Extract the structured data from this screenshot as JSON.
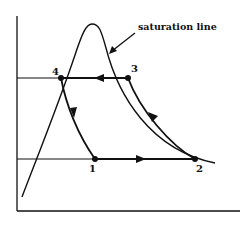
{
  "diagram": {
    "annotation": "saturation line",
    "points": [
      {
        "id": "1",
        "label": "1"
      },
      {
        "id": "2",
        "label": "2"
      },
      {
        "id": "3",
        "label": "3"
      },
      {
        "id": "4",
        "label": "4"
      }
    ],
    "processes": [
      {
        "from": "1",
        "to": "2",
        "type": "horizontal, arrow pointing right"
      },
      {
        "from": "2",
        "to": "3",
        "type": "curved, arrow pointing up-left"
      },
      {
        "from": "3",
        "to": "4",
        "type": "horizontal, arrow pointing left"
      },
      {
        "from": "4",
        "to": "1",
        "type": "curved, arrow pointing down"
      }
    ],
    "colors": {
      "ink": "#111111",
      "background": "#ffffff"
    }
  }
}
